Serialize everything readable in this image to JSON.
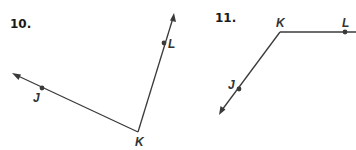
{
  "figures": [
    {
      "number": "10.",
      "vertex": {
        "label": "K",
        "x": 138,
        "y": 132
      },
      "points": [
        {
          "label": "J",
          "x": 42,
          "y": 88
        },
        {
          "label": "L",
          "x": 164,
          "y": 43
        }
      ],
      "rays": [
        {
          "from": "K",
          "through": "J",
          "arrow_tip": {
            "x": 12,
            "y": 73
          }
        },
        {
          "from": "K",
          "through": "L",
          "arrow_tip": {
            "x": 174,
            "y": 13
          }
        }
      ]
    },
    {
      "number": "11.",
      "vertex": {
        "label": "K",
        "x": 280,
        "y": 32
      },
      "points": [
        {
          "label": "J",
          "x": 239,
          "y": 89
        },
        {
          "label": "L",
          "x": 345,
          "y": 32
        }
      ],
      "rays": [
        {
          "from": "K",
          "through": "J",
          "arrow_tip": {
            "x": 219,
            "y": 115
          }
        },
        {
          "from": "K",
          "through": "L",
          "arrow_tip": {
            "x": 356,
            "y": 32
          }
        }
      ]
    }
  ],
  "colors": {
    "line": "#3a3a3a",
    "text": "#1a1a1a"
  }
}
